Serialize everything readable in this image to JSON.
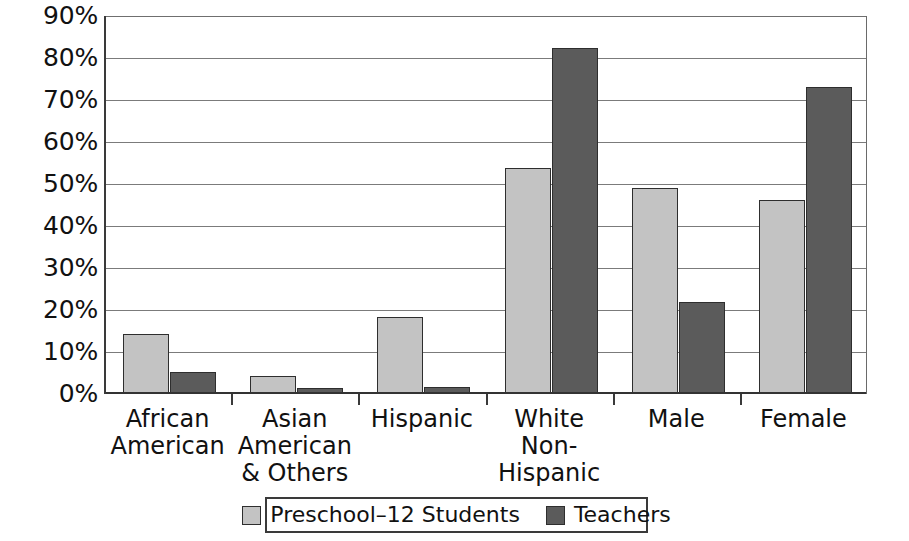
{
  "chart_data": {
    "type": "bar",
    "title": "",
    "subtitle": "",
    "xlabel": "",
    "ylabel": "",
    "ylim": [
      0,
      90
    ],
    "y_tick_labels": [
      "90%",
      "80%",
      "70%",
      "60%",
      "50%",
      "40%",
      "30%",
      "20%",
      "10%",
      "0%"
    ],
    "y_ticks": [
      90,
      80,
      70,
      60,
      50,
      40,
      30,
      20,
      10,
      0
    ],
    "grid": true,
    "legend_position": "bottom",
    "categories": [
      "African American",
      "Asian American & Others",
      "Hispanic",
      "White Non-Hispanic",
      "Male",
      "Female"
    ],
    "series": [
      {
        "name": "Preschool–12 Students",
        "color": "#c3c3c3",
        "values": [
          14.3,
          4.4,
          18.4,
          53.8,
          49.0,
          46.2
        ]
      },
      {
        "name": "Teachers",
        "color": "#5b5b5b",
        "values": [
          5.2,
          1.4,
          1.7,
          82.5,
          22.0,
          73.0
        ]
      }
    ]
  },
  "axis": {
    "y_labels": [
      {
        "text": "90%",
        "value": 90
      },
      {
        "text": "80%",
        "value": 80
      },
      {
        "text": "70%",
        "value": 70
      },
      {
        "text": "60%",
        "value": 60
      },
      {
        "text": "50%",
        "value": 50
      },
      {
        "text": "40%",
        "value": 40
      },
      {
        "text": "30%",
        "value": 30
      },
      {
        "text": "20%",
        "value": 20
      },
      {
        "text": "10%",
        "value": 10
      },
      {
        "text": "0%",
        "value": 0
      }
    ],
    "x_labels": [
      "African American",
      "Asian American & Others",
      "Hispanic",
      "White Non-Hispanic",
      "Male",
      "Female"
    ]
  },
  "legend": {
    "entries": [
      {
        "label": "Preschool–12 Students",
        "color": "#c3c3c3"
      },
      {
        "label": "Teachers",
        "color": "#5b5b5b"
      }
    ]
  },
  "colors": {
    "series_students": "#c3c3c3",
    "series_teachers": "#5b5b5b",
    "axis": "#333333",
    "gridline": "#7b7b7b",
    "background": "#ffffff"
  }
}
